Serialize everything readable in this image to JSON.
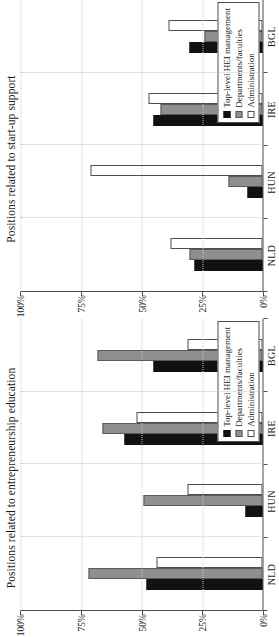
{
  "figure": {
    "orientation": "rotated-90-ccw",
    "panel_count": 2
  },
  "legend": {
    "position": "bottom-right-inside",
    "entries": [
      {
        "label": "Top-level HEI management",
        "color": "#111111",
        "swatch": "filled-black-square"
      },
      {
        "label": "Departments/faculties",
        "color": "#8f8f8f",
        "swatch": "filled-gray-square"
      },
      {
        "label": "Administration",
        "color": "#ffffff",
        "swatch": "open-white-square"
      }
    ]
  },
  "axis": {
    "ticks": [
      "100%",
      "75%",
      "50%",
      "25%",
      "0%"
    ],
    "tick_values": [
      100,
      75,
      50,
      25,
      0
    ],
    "categories": [
      "NLD",
      "HUN",
      "IRE",
      "BGL"
    ],
    "ylim": [
      0,
      100
    ]
  },
  "panels": [
    {
      "id": "startup-support",
      "title": "Positions related to start-up support"
    },
    {
      "id": "entrepreneurship-education",
      "title": "Positions related to entrepreneurship education"
    }
  ],
  "chart_data": [
    {
      "type": "bar",
      "title": "Positions related to start-up support",
      "categories": [
        "NLD",
        "HUN",
        "IRE",
        "BGL"
      ],
      "series": [
        {
          "name": "Top-level HEI management",
          "color": "#111111",
          "values": [
            28,
            6,
            45,
            30
          ]
        },
        {
          "name": "Departments/faculties",
          "color": "#8f8f8f",
          "values": [
            30,
            14,
            42,
            24
          ]
        },
        {
          "name": "Administration",
          "color": "#ffffff",
          "values": [
            38,
            71,
            47,
            39
          ]
        }
      ],
      "xlabel": "",
      "ylabel": "",
      "ylim": [
        0,
        100
      ],
      "ytick_labels": [
        "0%",
        "25%",
        "50%",
        "75%",
        "100%"
      ],
      "grid": true,
      "legend_position": "inside-bottom-right"
    },
    {
      "type": "bar",
      "title": "Positions related to entrepreneurship education",
      "categories": [
        "NLD",
        "HUN",
        "IRE",
        "BGL"
      ],
      "series": [
        {
          "name": "Top-level HEI management",
          "color": "#111111",
          "values": [
            48,
            7,
            57,
            45
          ]
        },
        {
          "name": "Departments/faculties",
          "color": "#8f8f8f",
          "values": [
            72,
            49,
            66,
            68
          ]
        },
        {
          "name": "Administration",
          "color": "#ffffff",
          "values": [
            44,
            31,
            52,
            31
          ]
        }
      ],
      "xlabel": "",
      "ylabel": "",
      "ylim": [
        0,
        100
      ],
      "ytick_labels": [
        "0%",
        "25%",
        "50%",
        "75%",
        "100%"
      ],
      "grid": true,
      "legend_position": "inside-bottom-right"
    }
  ]
}
